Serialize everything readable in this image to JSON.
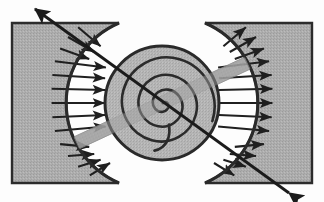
{
  "figure": {
    "width": 324,
    "height": 202,
    "background_color": "#fdfdfd"
  },
  "colors": {
    "block_fill": "#adadad",
    "block_fill_shadow": "#9d9d9d",
    "disk_fill": "#b4b4b4",
    "outline": "#2a2a2a",
    "arrow": "#1f1f1f",
    "bar_fill": "#9a9a9a",
    "gap_fill": "#fdfdfd",
    "texture": "#8f8f8f"
  },
  "blocks": [
    {
      "name": "left-block",
      "x": 12,
      "y": 23,
      "width": 107,
      "height": 160,
      "arc_side": "right",
      "arc_radius": 82,
      "label": "left block"
    },
    {
      "name": "right-block",
      "x": 205,
      "y": 23,
      "width": 107,
      "height": 160,
      "arc_side": "left",
      "arc_radius": 82,
      "label": "right block"
    }
  ],
  "disk": {
    "center_x": 162,
    "center_y": 103,
    "radius": 57,
    "outline_width": 3,
    "label": "central spiral disk"
  },
  "outer_arcs": {
    "radius": 87,
    "left_start_deg": 118,
    "left_end_deg": 242,
    "right_start_deg": -62,
    "right_end_deg": 62,
    "stroke_width": 3
  },
  "spiral": {
    "turns": 3.1,
    "start_radius": 2,
    "end_radius": 46,
    "start_angle_deg": 0,
    "stroke_width": 2.6,
    "tail_present": true,
    "label": "archimedean spiral"
  },
  "pressure_arrows": {
    "count_left": 13,
    "count_right": 13,
    "left_direction": "inward",
    "right_direction": "outward",
    "angle_span_deg": 124,
    "inner_radius": 57,
    "outer_radius": 87,
    "stroke_width": 2.2,
    "label": "radial pressure arrows"
  },
  "shear_bar": {
    "angle_deg": -25,
    "length": 188,
    "thickness": 13,
    "opacity": 0.72,
    "label": "diagonal shear bar"
  },
  "stress_arrow": {
    "x1": 289,
    "y1": 193,
    "x2": 35,
    "y2": 9,
    "double_headed": true,
    "stroke_width": 2.8,
    "head_size": 11,
    "label": "principal stress axis"
  }
}
